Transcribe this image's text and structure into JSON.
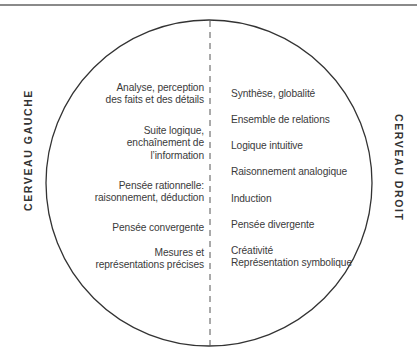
{
  "diagram": {
    "left_title": "CERVEAU GAUCHE",
    "right_title": "CERVEAU DROIT",
    "left_items": [
      {
        "lines": [
          "Analyse, perception",
          "des faits et des détails"
        ]
      },
      {
        "lines": [
          "Suite logique,",
          "enchaînement de",
          "l’information"
        ]
      },
      {
        "lines": [
          "Pensée rationnelle:",
          "raisonnement, déduction"
        ]
      },
      {
        "lines": [
          "Pensée convergente"
        ]
      },
      {
        "lines": [
          "Mesures et",
          "représentations précises"
        ]
      }
    ],
    "right_items": [
      {
        "lines": [
          "Synthèse, globalité"
        ]
      },
      {
        "lines": [
          "Ensemble de relations"
        ]
      },
      {
        "lines": [
          "Logique intuitive"
        ]
      },
      {
        "lines": [
          "Raisonnement analogique"
        ]
      },
      {
        "lines": [
          "Induction"
        ]
      },
      {
        "lines": [
          "Pensée divergente"
        ]
      },
      {
        "lines": [
          "Créativité",
          "Représentation symbolique"
        ]
      }
    ],
    "colors": {
      "stroke": "#333333",
      "text": "#3a3a3a",
      "rule": "#8a8a8a"
    }
  }
}
